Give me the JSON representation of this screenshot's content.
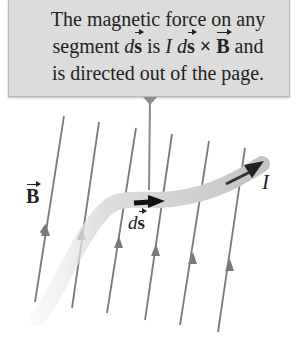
{
  "callout": {
    "line1": "The magnetic force on any",
    "line2_a": "segment ",
    "line2_ds_d": "d",
    "line2_ds_s": "s",
    "line2_b": " is ",
    "line2_I": "I",
    "line2_d": " d",
    "line2_s": "s",
    "line2_cross": " × ",
    "line2_B": "B",
    "line2_c": " and",
    "line3": "is directed out of the page."
  },
  "labels": {
    "field": "B",
    "segment_d": "d",
    "segment_s": "s",
    "current": "I"
  },
  "colors": {
    "callout_bg": "#dcdcdc",
    "field_line": "#7a7a7a",
    "wire": "#c8c8c8",
    "arrow": "#111111"
  }
}
